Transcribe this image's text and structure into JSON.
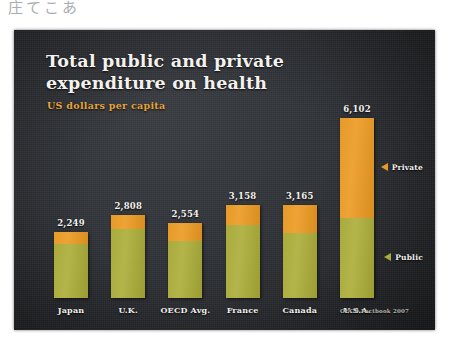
{
  "page": {
    "caption": "庄てこあ"
  },
  "slide": {
    "title": "Total public and private expenditure on health",
    "subtitle": "US dollars per capita",
    "source": "OECD Factbook 2007"
  },
  "legend": {
    "private": {
      "label": "Private",
      "marker": "triangle-left-icon",
      "color": "#e59a28"
    },
    "public": {
      "label": "Public",
      "marker": "triangle-left-icon",
      "color": "#a9ab3c"
    }
  },
  "colors": {
    "background": "#303338",
    "title": "#f4f2ee",
    "subtitle": "#e7a33a",
    "private": "#e59a28",
    "public": "#a9ab3c"
  },
  "chart_data": {
    "type": "bar",
    "title": "Total public and private expenditure on health",
    "subtitle": "US dollars per capita",
    "xlabel": "",
    "ylabel": "US dollars per capita",
    "ylim": [
      0,
      6102
    ],
    "grid": false,
    "stacked": true,
    "legend_position": "right",
    "categories": [
      "Japan",
      "U.K.",
      "OECD Avg.",
      "France",
      "Canada",
      "U.S.A."
    ],
    "series": [
      {
        "name": "Public",
        "color": "#a9ab3c",
        "values": [
          1840,
          2327,
          1917,
          2462,
          2209,
          2724
        ]
      },
      {
        "name": "Private",
        "color": "#e59a28",
        "values": [
          409,
          481,
          637,
          696,
          956,
          3378
        ]
      }
    ],
    "totals": [
      2249,
      2808,
      2554,
      3158,
      3165,
      6102
    ],
    "data_labels": [
      "2,249",
      "2,808",
      "2,554",
      "3,158",
      "3,165",
      "6,102"
    ],
    "annotations": [
      "OECD Factbook 2007"
    ]
  }
}
